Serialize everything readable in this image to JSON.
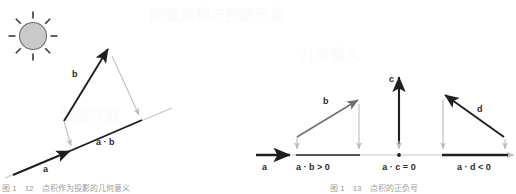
{
  "figure": {
    "background_color": "#ffffff",
    "dark_ink": "#1f1f1f",
    "gray_ink": "#b0b0b0",
    "mid_gray": "#8c8c8c",
    "sun_fill": "#c9c9c9",
    "sun_stroke": "#6f6f6f"
  },
  "left_panel": {
    "name": "projection-of-b-onto-a",
    "sun_icon": "sun-icon",
    "labels": {
      "vector_b": "b",
      "vector_a": "a",
      "projection": "a · b"
    },
    "caption": "图 1　12　点积作为投影的几何意义"
  },
  "right_panel": {
    "name": "sign-of-dot-product-cases",
    "labels": {
      "vector_a": "a",
      "vector_b": "b",
      "vector_c": "c",
      "vector_d": "d"
    },
    "cases": [
      {
        "id": "case-positive",
        "label": "a · b > 0"
      },
      {
        "id": "case-zero",
        "label": "a · c = 0"
      },
      {
        "id": "case-negative",
        "label": "a · d < 0"
      }
    ],
    "caption": "图 1　13　点积的正负号"
  },
  "watermark": {
    "line_top": "向量点积与投影示意",
    "line_mid": "几何意义",
    "line_low": "线性代数"
  }
}
